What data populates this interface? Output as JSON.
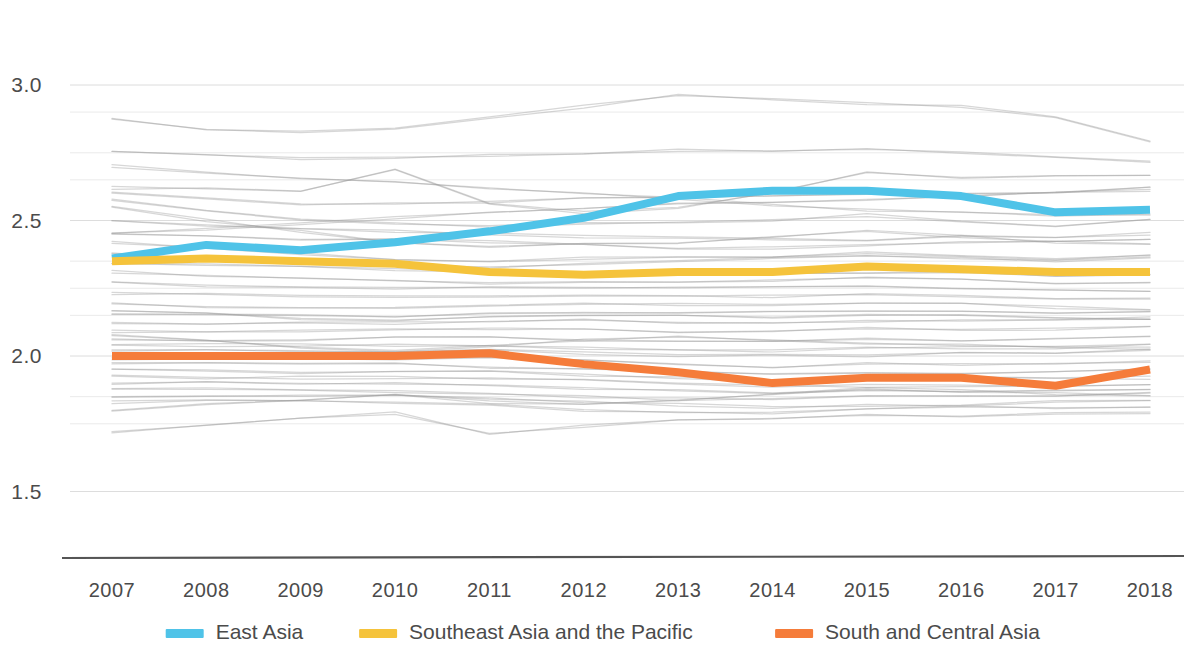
{
  "chart_data": {
    "type": "line",
    "title": "",
    "subtitle": "",
    "xlabel": "",
    "ylabel": "",
    "x": [
      2007,
      2008,
      2009,
      2010,
      2011,
      2012,
      2013,
      2014,
      2015,
      2016,
      2017,
      2018
    ],
    "xtick_labels": [
      "2007",
      "2008",
      "2009",
      "2010",
      "2011",
      "2012",
      "2013",
      "2014",
      "2015",
      "2016",
      "2017",
      "2018"
    ],
    "ytick_labels": [
      "3.0",
      "2.5",
      "2.0",
      "1.5"
    ],
    "ytick_values": [
      3.0,
      2.5,
      2.0,
      1.5
    ],
    "ylim": [
      1.35,
      3.12
    ],
    "xlim": [
      2007,
      2018
    ],
    "grid": true,
    "minor_gridlines": [
      2.9,
      2.75,
      2.65,
      2.35,
      2.25,
      2.15,
      1.85,
      1.75
    ],
    "legend_position": "bottom",
    "series": [
      {
        "name": "East Asia",
        "color": "#4FC3E8",
        "highlight": true,
        "values": [
          2.36,
          2.41,
          2.39,
          2.42,
          2.46,
          2.51,
          2.59,
          2.61,
          2.61,
          2.59,
          2.53,
          2.54
        ]
      },
      {
        "name": "Southeast Asia and the Pacific",
        "color": "#F5C33B",
        "highlight": true,
        "values": [
          2.35,
          2.36,
          2.35,
          2.34,
          2.31,
          2.3,
          2.31,
          2.31,
          2.33,
          2.32,
          2.31,
          2.31
        ]
      },
      {
        "name": "South and Central Asia",
        "color": "#F57C3A",
        "highlight": true,
        "values": [
          2.0,
          2.0,
          2.0,
          2.0,
          2.01,
          1.97,
          1.94,
          1.9,
          1.92,
          1.92,
          1.89,
          1.95
        ]
      }
    ],
    "background_series": [
      {
        "name": "bg-1",
        "values": [
          2.88,
          2.84,
          2.83,
          2.84,
          2.88,
          2.92,
          2.96,
          2.95,
          2.93,
          2.92,
          2.88,
          2.79
        ]
      },
      {
        "name": "bg-2",
        "values": [
          2.75,
          2.74,
          2.73,
          2.73,
          2.74,
          2.75,
          2.76,
          2.76,
          2.76,
          2.75,
          2.73,
          2.72
        ]
      },
      {
        "name": "bg-3",
        "values": [
          2.62,
          2.62,
          2.61,
          2.69,
          2.56,
          2.53,
          2.55,
          2.6,
          2.68,
          2.66,
          2.66,
          2.67
        ]
      },
      {
        "name": "bg-4",
        "values": [
          2.6,
          2.58,
          2.56,
          2.56,
          2.57,
          2.58,
          2.59,
          2.59,
          2.6,
          2.6,
          2.6,
          2.62
        ]
      },
      {
        "name": "bg-5",
        "values": [
          2.58,
          2.54,
          2.5,
          2.49,
          2.48,
          2.49,
          2.49,
          2.5,
          2.52,
          2.5,
          2.48,
          2.5
        ]
      },
      {
        "name": "bg-6",
        "values": [
          2.5,
          2.48,
          2.47,
          2.46,
          2.45,
          2.44,
          2.44,
          2.43,
          2.43,
          2.44,
          2.44,
          2.45
        ]
      },
      {
        "name": "bg-7",
        "values": [
          2.45,
          2.44,
          2.43,
          2.43,
          2.42,
          2.41,
          2.4,
          2.4,
          2.41,
          2.42,
          2.42,
          2.43
        ]
      },
      {
        "name": "bg-8",
        "values": [
          2.42,
          2.4,
          2.38,
          2.36,
          2.35,
          2.36,
          2.37,
          2.37,
          2.38,
          2.37,
          2.36,
          2.37
        ]
      },
      {
        "name": "bg-9",
        "values": [
          2.38,
          2.36,
          2.34,
          2.33,
          2.33,
          2.34,
          2.35,
          2.36,
          2.37,
          2.36,
          2.35,
          2.36
        ]
      },
      {
        "name": "bg-10",
        "values": [
          2.34,
          2.34,
          2.33,
          2.32,
          2.31,
          2.3,
          2.3,
          2.3,
          2.31,
          2.31,
          2.3,
          2.3
        ]
      },
      {
        "name": "bg-11",
        "values": [
          2.31,
          2.3,
          2.29,
          2.28,
          2.27,
          2.27,
          2.27,
          2.28,
          2.29,
          2.28,
          2.27,
          2.27
        ]
      },
      {
        "name": "bg-12",
        "values": [
          2.27,
          2.26,
          2.25,
          2.25,
          2.25,
          2.25,
          2.25,
          2.25,
          2.26,
          2.25,
          2.24,
          2.24
        ]
      },
      {
        "name": "bg-13",
        "values": [
          2.23,
          2.23,
          2.22,
          2.22,
          2.22,
          2.22,
          2.22,
          2.22,
          2.23,
          2.22,
          2.21,
          2.21
        ]
      },
      {
        "name": "bg-14",
        "values": [
          2.19,
          2.18,
          2.18,
          2.18,
          2.19,
          2.19,
          2.19,
          2.19,
          2.2,
          2.19,
          2.18,
          2.17
        ]
      },
      {
        "name": "bg-15",
        "values": [
          2.15,
          2.15,
          2.15,
          2.15,
          2.16,
          2.16,
          2.16,
          2.16,
          2.17,
          2.16,
          2.16,
          2.16
        ]
      },
      {
        "name": "bg-16",
        "values": [
          2.12,
          2.12,
          2.12,
          2.12,
          2.13,
          2.13,
          2.12,
          2.12,
          2.13,
          2.13,
          2.13,
          2.14
        ]
      },
      {
        "name": "bg-17",
        "values": [
          2.09,
          2.09,
          2.09,
          2.1,
          2.1,
          2.1,
          2.09,
          2.09,
          2.1,
          2.1,
          2.1,
          2.11
        ]
      },
      {
        "name": "bg-18",
        "values": [
          2.06,
          2.06,
          2.06,
          2.07,
          2.07,
          2.06,
          2.05,
          2.05,
          2.06,
          2.06,
          2.06,
          2.07
        ]
      },
      {
        "name": "bg-19",
        "values": [
          2.04,
          2.04,
          2.04,
          2.04,
          2.04,
          2.03,
          2.02,
          2.02,
          2.03,
          2.03,
          2.03,
          2.04
        ]
      },
      {
        "name": "bg-20",
        "values": [
          2.02,
          2.02,
          2.02,
          2.02,
          2.02,
          2.01,
          2.0,
          2.0,
          2.0,
          2.01,
          2.01,
          2.02
        ]
      },
      {
        "name": "bg-21",
        "values": [
          1.99,
          1.99,
          1.99,
          1.99,
          1.99,
          1.98,
          1.97,
          1.96,
          1.97,
          1.97,
          1.97,
          1.98
        ]
      },
      {
        "name": "bg-22",
        "values": [
          1.97,
          1.97,
          1.97,
          1.97,
          1.96,
          1.95,
          1.94,
          1.93,
          1.94,
          1.94,
          1.94,
          1.95
        ]
      },
      {
        "name": "bg-23",
        "values": [
          1.95,
          1.95,
          1.94,
          1.94,
          1.94,
          1.93,
          1.92,
          1.91,
          1.91,
          1.92,
          1.92,
          1.92
        ]
      },
      {
        "name": "bg-24",
        "values": [
          1.93,
          1.92,
          1.92,
          1.92,
          1.92,
          1.91,
          1.9,
          1.89,
          1.89,
          1.89,
          1.89,
          1.9
        ]
      },
      {
        "name": "bg-25",
        "values": [
          1.9,
          1.9,
          1.9,
          1.9,
          1.89,
          1.88,
          1.87,
          1.86,
          1.87,
          1.87,
          1.87,
          1.88
        ]
      },
      {
        "name": "bg-26",
        "values": [
          1.88,
          1.88,
          1.87,
          1.87,
          1.86,
          1.85,
          1.84,
          1.84,
          1.85,
          1.85,
          1.85,
          1.86
        ]
      },
      {
        "name": "bg-27",
        "values": [
          1.85,
          1.85,
          1.85,
          1.85,
          1.84,
          1.83,
          1.82,
          1.81,
          1.82,
          1.82,
          1.83,
          1.84
        ]
      },
      {
        "name": "bg-28",
        "values": [
          1.83,
          1.84,
          1.84,
          1.83,
          1.82,
          1.8,
          1.79,
          1.79,
          1.8,
          1.81,
          1.81,
          1.81
        ]
      },
      {
        "name": "bg-29",
        "values": [
          1.72,
          1.74,
          1.77,
          1.79,
          1.71,
          1.74,
          1.76,
          1.77,
          1.78,
          1.78,
          1.79,
          1.79
        ]
      },
      {
        "name": "bg-30",
        "values": [
          2.55,
          2.5,
          2.46,
          2.42,
          2.4,
          2.41,
          2.42,
          2.44,
          2.46,
          2.44,
          2.42,
          2.41
        ]
      },
      {
        "name": "bg-31",
        "values": [
          2.7,
          2.68,
          2.66,
          2.64,
          2.62,
          2.6,
          2.58,
          2.56,
          2.54,
          2.53,
          2.52,
          2.52
        ]
      },
      {
        "name": "bg-32",
        "values": [
          2.45,
          2.47,
          2.49,
          2.51,
          2.53,
          2.54,
          2.56,
          2.57,
          2.58,
          2.59,
          2.6,
          2.61
        ]
      },
      {
        "name": "bg-33",
        "values": [
          2.17,
          2.16,
          2.14,
          2.13,
          2.14,
          2.15,
          2.15,
          2.14,
          2.15,
          2.15,
          2.14,
          2.13
        ]
      },
      {
        "name": "bg-34",
        "values": [
          2.08,
          2.06,
          2.03,
          2.02,
          2.04,
          2.06,
          2.07,
          2.06,
          2.05,
          2.04,
          2.03,
          2.03
        ]
      },
      {
        "name": "bg-35",
        "values": [
          1.8,
          1.82,
          1.84,
          1.86,
          1.83,
          1.82,
          1.84,
          1.86,
          1.88,
          1.87,
          1.86,
          1.85
        ]
      }
    ]
  },
  "legend": {
    "items": [
      {
        "label": "East Asia",
        "color": "#4FC3E8"
      },
      {
        "label": "Southeast Asia and the Pacific",
        "color": "#F5C33B"
      },
      {
        "label": "South and Central Asia",
        "color": "#F57C3A"
      }
    ]
  }
}
